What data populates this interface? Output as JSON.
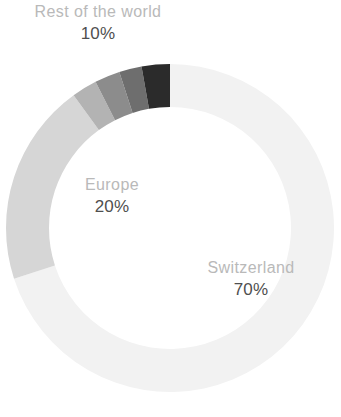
{
  "chart_data": {
    "type": "pie",
    "variant": "donut",
    "title": "",
    "subtitle": "",
    "xlabel": "",
    "ylabel": "",
    "legend_position": "inline-labels",
    "grid": false,
    "units": "%",
    "total": 100,
    "categories": [
      "Switzerland",
      "Europe",
      "Rest of the world"
    ],
    "values": [
      70,
      20,
      10
    ],
    "labels": [
      "70%",
      "20%",
      "10%"
    ],
    "colors": [
      "#f2f2f2",
      "#d6d6d6",
      "#2b2b2b"
    ],
    "start_angle_deg": 0,
    "direction": "clockwise",
    "slices": [
      {
        "name": "Switzerland",
        "value": 70,
        "value_label": "70%",
        "color": "#f2f2f2",
        "start_deg": 0,
        "end_deg": 252
      },
      {
        "name": "Europe",
        "value": 20,
        "value_label": "20%",
        "color": "#d6d6d6",
        "start_deg": 252,
        "end_deg": 324
      },
      {
        "name": "Rest of the world",
        "value": 10,
        "value_label": "10%",
        "color": "#2b2b2b",
        "start_deg": 324,
        "end_deg": 360,
        "sub_bands": [
          {
            "color": "#b3b3b3",
            "start_deg": 324,
            "end_deg": 333
          },
          {
            "color": "#8c8c8c",
            "start_deg": 333,
            "end_deg": 342
          },
          {
            "color": "#6e6e6e",
            "start_deg": 342,
            "end_deg": 350
          },
          {
            "color": "#2b2b2b",
            "start_deg": 350,
            "end_deg": 360
          }
        ]
      }
    ]
  },
  "labels": {
    "rest_of_world": {
      "name": "Rest of the world",
      "value": "10%"
    },
    "europe": {
      "name": "Europe",
      "value": "20%"
    },
    "switzerland": {
      "name": "Switzerland",
      "value": "70%"
    }
  },
  "geometry": {
    "center_x": 170,
    "center_y": 228,
    "outer_radius": 164,
    "inner_radius": 121
  },
  "theme": {
    "background": "#ffffff",
    "label_text_color": "#b9b9b9",
    "value_text_color": "#4f4f4f"
  }
}
